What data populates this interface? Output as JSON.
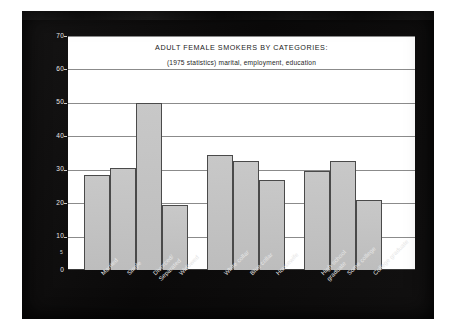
{
  "chart_data": {
    "type": "bar",
    "title": "ADULT FEMALE SMOKERS BY CATEGORIES:",
    "subtitle": "(1975 statistics) marital, employment, education",
    "xlabel": "",
    "ylabel": "Percentage of smokers in each category",
    "ylim": [
      0,
      70
    ],
    "ytick_values": [
      0,
      10,
      20,
      30,
      40,
      50,
      60,
      70
    ],
    "ytick_labels": [
      "0",
      "10",
      "20",
      "30",
      "40",
      "50",
      "60",
      "70"
    ],
    "minor_tick_label": "5",
    "grid": true,
    "legend": "none",
    "categories": [
      "Married",
      "Single",
      "Divorced/Separated",
      "Widowed",
      "White collar",
      "Blue collar",
      "Housewife",
      "High school graduate",
      "Some college",
      "College graduate"
    ],
    "values": [
      28.5,
      30.5,
      50,
      19.5,
      34.5,
      32.5,
      27,
      29.5,
      32.5,
      21
    ],
    "groups": [
      {
        "name": "marital",
        "categories": [
          "Married",
          "Single",
          "Divorced/Separated",
          "Widowed"
        ]
      },
      {
        "name": "employment",
        "categories": [
          "White collar",
          "Blue collar",
          "Housewife"
        ]
      },
      {
        "name": "education",
        "categories": [
          "High school graduate",
          "Some college",
          "College graduate"
        ]
      }
    ],
    "bars": [
      {
        "label_line1": "Married",
        "label_line2": "",
        "value": 28.5
      },
      {
        "label_line1": "Single",
        "label_line2": "",
        "value": 30.5
      },
      {
        "label_line1": "Divorced/",
        "label_line2": "Separated",
        "value": 50
      },
      {
        "label_line1": "Widowed",
        "label_line2": "",
        "value": 19.5
      },
      {
        "label_line1": "White collar",
        "label_line2": "",
        "value": 34.5
      },
      {
        "label_line1": "Blue collar",
        "label_line2": "",
        "value": 32.5
      },
      {
        "label_line1": "Housewife",
        "label_line2": "",
        "value": 27
      },
      {
        "label_line1": "High school",
        "label_line2": "graduate",
        "value": 29.5
      },
      {
        "label_line1": "Some college",
        "label_line2": "",
        "value": 32.5
      },
      {
        "label_line1": "College graduate",
        "label_line2": "",
        "value": 21
      }
    ],
    "colors": {
      "bar_fill": "#c2c2c2",
      "bar_border": "#4a4a4a",
      "plot_background": "#ffffff",
      "gridline": "#8b8b8b",
      "board_background": "#0d0c0c",
      "axis_text": "#e6e6e6",
      "title_text": "#1a1a1a"
    }
  }
}
